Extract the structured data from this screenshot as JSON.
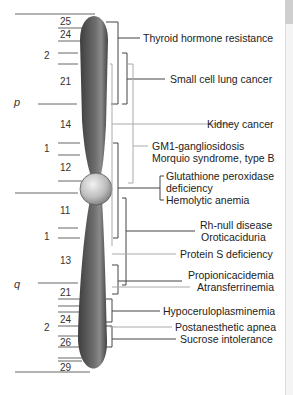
{
  "diagram": {
    "arms": {
      "p": "p",
      "q": "q"
    },
    "bands": [
      {
        "label": "25",
        "y": 21
      },
      {
        "label": "24",
        "y": 34
      },
      {
        "label": "2",
        "y": 55
      },
      {
        "label": "21",
        "y": 81
      },
      {
        "label": "14",
        "y": 125
      },
      {
        "label": "1",
        "y": 148
      },
      {
        "label": "12",
        "y": 168
      },
      {
        "label": "11",
        "y": 210
      },
      {
        "label": "1",
        "y": 236
      },
      {
        "label": "13",
        "y": 260
      },
      {
        "label": "21",
        "y": 292
      },
      {
        "label": "24",
        "y": 320
      },
      {
        "label": "2",
        "y": 326
      },
      {
        "label": "26",
        "y": 342
      },
      {
        "label": "29",
        "y": 366
      }
    ],
    "diseases": [
      {
        "label": "Thyroid hormone resistance",
        "y": 38
      },
      {
        "label": "Small cell lung cancer",
        "y": 79
      },
      {
        "label": "Kidney cancer",
        "y": 124
      },
      {
        "label": "GM1-gangliosidosis",
        "y": 146
      },
      {
        "label": "Morquio syndrome, type B",
        "y": 158
      },
      {
        "label": "Glutathione peroxidase",
        "y": 176
      },
      {
        "label": "deficiency",
        "y": 188
      },
      {
        "label": "Hemolytic anemia",
        "y": 200
      },
      {
        "label": "Rh-null disease",
        "y": 225
      },
      {
        "label": "Oroticaciduria",
        "y": 237
      },
      {
        "label": "Protein S deficiency",
        "y": 254
      },
      {
        "label": "Propionicacidemia",
        "y": 275
      },
      {
        "label": "Atransferrinemia",
        "y": 287
      },
      {
        "label": "Hypoceruloplasminemia",
        "y": 311
      },
      {
        "label": "Postanesthetic apnea",
        "y": 327
      },
      {
        "label": "Sucrose intolerance",
        "y": 339
      }
    ],
    "colors": {
      "chromosome": "#5a5a5a",
      "centromere": "#bdbdbd",
      "line": "#555555",
      "line_light": "#aaaaaa"
    }
  }
}
